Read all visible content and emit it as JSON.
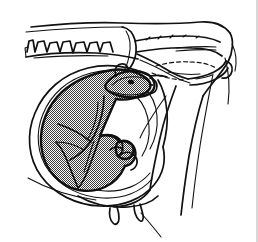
{
  "figure": {
    "caption": "",
    "domain_label": "veterinary-obstetrics-line-drawing",
    "background_color": "#ffffff",
    "ink_color": "#111111",
    "shading_color": "#808080",
    "width_px": 258,
    "height_px": 242,
    "style": "black-and-white line art with halftone stipple shading"
  },
  "parts": [
    {
      "id": "dam-outline",
      "label": "Dam body outline (lateral view)"
    },
    {
      "id": "vertebral-column",
      "label": "Vertebral column with spinous processes"
    },
    {
      "id": "sacrum-tailhead",
      "label": "Sacrum and tail head"
    },
    {
      "id": "pelvis",
      "label": "Pelvic bone (ilium, ischium)"
    },
    {
      "id": "birth-canal",
      "label": "Birth canal passage (dashed)"
    },
    {
      "id": "uterus-wall",
      "label": "Uterine wall (concentric layers)"
    },
    {
      "id": "fetus-body",
      "label": "Fetus, shaded"
    },
    {
      "id": "fetus-head",
      "label": "Fetal head entering pelvic inlet"
    },
    {
      "id": "fetus-eye",
      "label": "Fetal eye"
    },
    {
      "id": "fetus-forelimbs",
      "label": "Fetal forelimbs and hooves"
    },
    {
      "id": "hind-limb",
      "label": "Dam hind limb / thigh"
    },
    {
      "id": "udder-teats",
      "label": "Udder with teats"
    },
    {
      "id": "ventral-abdomen",
      "label": "Ventral abdominal wall"
    }
  ],
  "annotations": [],
  "legend": []
}
